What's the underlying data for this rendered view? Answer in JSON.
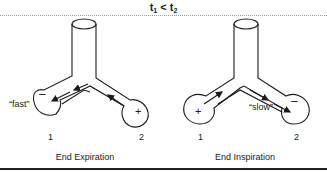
{
  "header": {
    "title_t1": "t",
    "title_sub1": "1",
    "title_op": " < ",
    "title_t2": "t",
    "title_sub2": "2"
  },
  "panels": [
    {
      "caption": "End Expiration",
      "speed_label": "“fast”",
      "unit_labels": [
        "1",
        "2"
      ],
      "signs": [
        "–",
        "+"
      ],
      "flow_direction": "from unit 2 to unit 1"
    },
    {
      "caption": "End Inspiration",
      "speed_label": "“slow”",
      "unit_labels": [
        "1",
        "2"
      ],
      "signs": [
        "+",
        "–"
      ],
      "flow_direction": "from unit 1 to unit 2"
    }
  ],
  "colors": {
    "line": "#1a1a1a",
    "dotted_rule": "#999999",
    "background": "#ffffff"
  }
}
